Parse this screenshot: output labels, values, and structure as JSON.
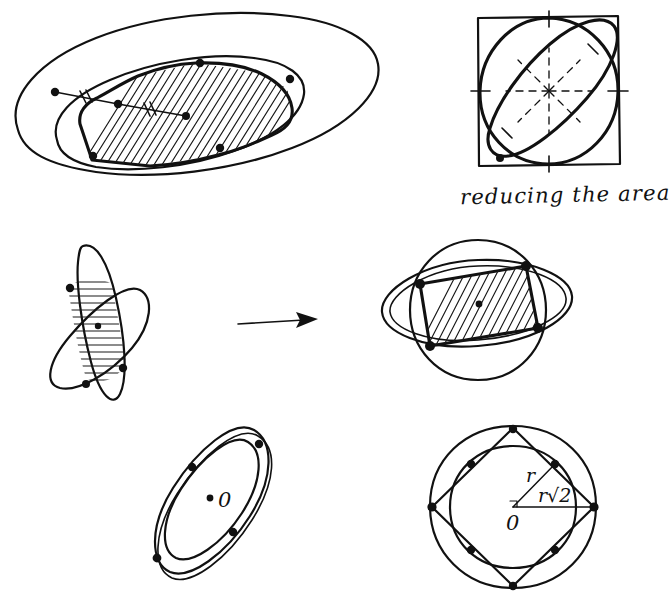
{
  "document": {
    "title": "reducing the area",
    "medium": "hand-drawn pen sketch",
    "background_color": "#ffffff",
    "ink_color": "#111111"
  },
  "captions": {
    "reducing_the_area": "reducing the area"
  },
  "figures": [
    {
      "id": "fig-top-left",
      "name": "ellipse-with-inscribed-convex-hull",
      "description": "A large tilted outer ellipse containing an inner tilted ellipse and a hatched convex body with marked boundary points; two short segments carry double tick marks indicating equal lengths.",
      "hatching": "diagonal",
      "marked_points": 6,
      "tick_marks": 2
    },
    {
      "id": "fig-top-right",
      "name": "square-circle-tilted-ellipse",
      "description": "A square with an inscribed circle and a tilted ellipse through the square, dashed radial spokes from the centre and tick marks on the axes.",
      "caption": "reducing the area",
      "dashed_spokes": 8
    },
    {
      "id": "fig-mid-left",
      "name": "two-crossed-narrow-ellipses",
      "description": "Two steeply tilted narrow ellipses intersecting in a lens region filled with horizontal hatching, centre dot marked.",
      "hatching": "horizontal",
      "marked_points": 3
    },
    {
      "id": "fig-arrow",
      "name": "transformation-arrow",
      "description": "Rightward arrow indicating the transformation from the crossed narrow ellipses to the rounded configuration.",
      "direction": "right"
    },
    {
      "id": "fig-mid-right",
      "name": "round-and-flat-ellipse-overlap",
      "description": "A near-circular ellipse crossing a wide flat ellipse; the overlapping quadrilateral region is filled with diagonal hatching and the centre is dotted.",
      "hatching": "diagonal",
      "marked_points": 4
    },
    {
      "id": "fig-bottom-left",
      "name": "nested-tilted-ellipses",
      "description": "Two concentric tilted ellipses touching at four marked points, centre labelled 0.",
      "marked_points": 4,
      "center_label": "0"
    },
    {
      "id": "fig-bottom-right",
      "name": "circle-square-circumscribed",
      "description": "An inner circle of radius r and an outer circle of radius r times root two, with a rotated square whose vertices lie on the outer circle; the radii are labelled.",
      "center_label": "0",
      "labels": {
        "inner_radius": "r",
        "outer_radius": "r√2"
      },
      "marked_points": 8
    }
  ]
}
